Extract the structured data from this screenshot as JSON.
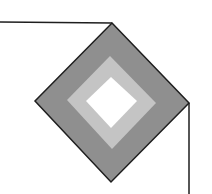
{
  "diagram": {
    "title": "",
    "colors": {
      "background": "#ffffff",
      "outer_fill": "#8f8f8f",
      "middle_fill": "#c4c4c4",
      "inner_fill": "#ffffff",
      "stroke": "#1e1e1e"
    },
    "shapes": {
      "outer_diamond": "112,23 189,103 111,182 35,101",
      "middle_diamond": "110,56 156,103 112,149 67,100",
      "inner_diamond": "111,77 137,101 111,128 86,101"
    },
    "lines": {
      "top_line": {
        "x1": 0,
        "y1": 22,
        "x2": 112,
        "y2": 23
      },
      "right_line": {
        "x1": 189,
        "y1": 103,
        "x2": 189,
        "y2": 194
      }
    }
  }
}
